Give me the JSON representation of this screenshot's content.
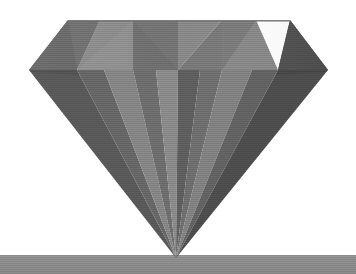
{
  "scene": {
    "title": "Diamond Gemstone 3D Render",
    "description": "Grayscale faceted brilliant-cut diamond resting tip-down on a flat ground plane",
    "width": 356,
    "height": 274,
    "background_color": "#ffffff",
    "render_style": "flat-shaded low-poly grayscale",
    "noise": "fine dithered grain"
  },
  "ground": {
    "name": "ground-plane",
    "top_y": 255,
    "bottom_y": 274,
    "color": "#8b8b8b",
    "highlight_color": "#949494",
    "shadow_color": "#828282"
  },
  "gem": {
    "name": "diamond",
    "table_top_y": 20,
    "girdle_y": 70,
    "tip": {
      "x": 176,
      "y": 258
    },
    "girdle_left_x": 29,
    "girdle_right_x": 328,
    "table_left_x": 68,
    "table_right_x": 290,
    "colors": {
      "lightest": "#9a9a9a",
      "light": "#8d8d8d",
      "mid_light": "#828282",
      "mid": "#757575",
      "mid_dark": "#6a6a6a",
      "dark": "#5c5c5c",
      "darker": "#515151",
      "darkest": "#464646"
    }
  },
  "crown_facets": [
    {
      "name": "crown-facet-far-left-upper",
      "points": "68,20 100,20 77,70 29,70",
      "fill": "#6f6f6f"
    },
    {
      "name": "crown-facet-left-outer",
      "points": "100,20 68,20 29,70 77,70",
      "fill": "#6a6a6a"
    },
    {
      "name": "crown-facet-left-kite",
      "points": "100,20 133,20 133,70 77,70",
      "fill": "#8d8d8d"
    },
    {
      "name": "crown-facet-left-star",
      "points": "133,20 178,20 133,70",
      "fill": "#848484"
    },
    {
      "name": "crown-facet-left-table-v",
      "points": "133,20 178,20 178,70 133,70",
      "fill": "#6f6f6f"
    },
    {
      "name": "crown-facet-center-left-v",
      "points": "133,20 178,70 178,20",
      "fill": "#737373"
    },
    {
      "name": "crown-facet-center-right-v",
      "points": "222,20 178,70 178,20",
      "fill": "#888888"
    },
    {
      "name": "crown-facet-right-table-v",
      "points": "178,20 222,20 222,70 178,70",
      "fill": "#7b7b7b"
    },
    {
      "name": "crown-facet-right-star",
      "points": "222,20 256,20 222,70",
      "fill": "#7c7c7c"
    },
    {
      "name": "crown-facet-right-kite",
      "points": "222,20 256,20 278,70 222,70",
      "fill": "#888888"
    },
    {
      "name": "crown-facet-far-right-upper",
      "points": "256,20 290,20 328,70 278,70",
      "fill": "#5e5e5e"
    },
    {
      "name": "crown-facet-far-right-outer",
      "points": "290,20 328,70 278,70",
      "fill": "#545454"
    }
  ],
  "pavilion_facets": [
    {
      "name": "pavilion-facet-1",
      "points": "29,70 77,70 176,258",
      "fill": "#595959"
    },
    {
      "name": "pavilion-facet-2",
      "points": "77,70 104,70 176,258",
      "fill": "#666666"
    },
    {
      "name": "pavilion-facet-3",
      "points": "104,70 133,70 176,258",
      "fill": "#858585"
    },
    {
      "name": "pavilion-facet-4",
      "points": "133,70 156,70 176,258",
      "fill": "#6d6d6d"
    },
    {
      "name": "pavilion-facet-5",
      "points": "156,70 178,70 176,258",
      "fill": "#8a8a8a"
    },
    {
      "name": "pavilion-facet-6",
      "points": "178,70 200,70 176,258",
      "fill": "#5e5e5e"
    },
    {
      "name": "pavilion-facet-7",
      "points": "200,70 222,70 176,258",
      "fill": "#6e6e6e"
    },
    {
      "name": "pavilion-facet-8",
      "points": "222,70 252,70 176,258",
      "fill": "#818181"
    },
    {
      "name": "pavilion-facet-9",
      "points": "252,70 278,70 176,258",
      "fill": "#626262"
    },
    {
      "name": "pavilion-facet-10",
      "points": "278,70 328,70 176,258",
      "fill": "#4d4d4d"
    }
  ],
  "girdle_band": [
    {
      "name": "girdle-seg-left",
      "points": "29,70 77,70 77,74 29,72",
      "fill": "#4f4f4f"
    },
    {
      "name": "girdle-seg-right",
      "points": "278,70 328,70 328,72 278,74",
      "fill": "#464646"
    }
  ]
}
